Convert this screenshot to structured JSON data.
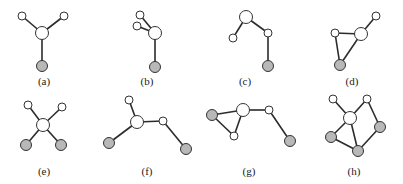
{
  "figure": {
    "colors": {
      "node_white": "#ffffff",
      "node_gray": "#b8b8b8",
      "edge": "#2b2b2b",
      "outline": "#333333"
    },
    "graphs": [
      {
        "label": "(a)",
        "nodes": [
          {
            "id": "hub",
            "type": "hub",
            "color": "white"
          },
          {
            "id": "n1",
            "type": "small",
            "color": "white"
          },
          {
            "id": "n2",
            "type": "small",
            "color": "white"
          },
          {
            "id": "n3",
            "type": "medium",
            "color": "gray"
          }
        ],
        "edges": [
          [
            "hub",
            "n1"
          ],
          [
            "hub",
            "n2"
          ],
          [
            "hub",
            "n3"
          ]
        ]
      },
      {
        "label": "(b)",
        "nodes": [
          {
            "id": "hub",
            "type": "hub",
            "color": "white"
          },
          {
            "id": "n1",
            "type": "small",
            "color": "white"
          },
          {
            "id": "n2",
            "type": "small",
            "color": "white"
          },
          {
            "id": "n3",
            "type": "medium",
            "color": "gray"
          }
        ],
        "edges": [
          [
            "hub",
            "n1"
          ],
          [
            "hub",
            "n2"
          ],
          [
            "hub",
            "n3"
          ]
        ]
      },
      {
        "label": "(c)",
        "nodes": [
          {
            "id": "hub",
            "type": "hub",
            "color": "white"
          },
          {
            "id": "n1",
            "type": "small",
            "color": "white"
          },
          {
            "id": "n2",
            "type": "small",
            "color": "white"
          },
          {
            "id": "n3",
            "type": "medium",
            "color": "gray"
          }
        ],
        "edges": [
          [
            "hub",
            "n1"
          ],
          [
            "hub",
            "n2"
          ],
          [
            "n2",
            "n3"
          ]
        ]
      },
      {
        "label": "(d)",
        "nodes": [
          {
            "id": "hub",
            "type": "hub",
            "color": "white"
          },
          {
            "id": "n1",
            "type": "small",
            "color": "white"
          },
          {
            "id": "n2",
            "type": "small",
            "color": "white"
          },
          {
            "id": "n3",
            "type": "medium",
            "color": "gray"
          }
        ],
        "edges": [
          [
            "hub",
            "n1"
          ],
          [
            "hub",
            "n2"
          ],
          [
            "hub",
            "n3"
          ],
          [
            "n1",
            "n3"
          ]
        ]
      },
      {
        "label": "(e)",
        "nodes": [
          {
            "id": "hub",
            "type": "hub",
            "color": "white"
          },
          {
            "id": "n1",
            "type": "small",
            "color": "white"
          },
          {
            "id": "n2",
            "type": "small",
            "color": "white"
          },
          {
            "id": "n3",
            "type": "medium",
            "color": "gray"
          },
          {
            "id": "n4",
            "type": "medium",
            "color": "gray"
          }
        ],
        "edges": [
          [
            "hub",
            "n1"
          ],
          [
            "hub",
            "n2"
          ],
          [
            "hub",
            "n3"
          ],
          [
            "hub",
            "n4"
          ]
        ]
      },
      {
        "label": "(f)",
        "nodes": [
          {
            "id": "hub",
            "type": "hub",
            "color": "white"
          },
          {
            "id": "n1",
            "type": "small",
            "color": "white"
          },
          {
            "id": "n2",
            "type": "small",
            "color": "white"
          },
          {
            "id": "n3",
            "type": "medium",
            "color": "gray"
          },
          {
            "id": "n4",
            "type": "medium",
            "color": "gray"
          }
        ],
        "edges": [
          [
            "hub",
            "n1"
          ],
          [
            "hub",
            "n2"
          ],
          [
            "hub",
            "n3"
          ],
          [
            "n2",
            "n4"
          ]
        ]
      },
      {
        "label": "(g)",
        "nodes": [
          {
            "id": "hub",
            "type": "hub",
            "color": "white"
          },
          {
            "id": "n1",
            "type": "medium",
            "color": "gray"
          },
          {
            "id": "n2",
            "type": "small",
            "color": "white"
          },
          {
            "id": "n3",
            "type": "small",
            "color": "white"
          },
          {
            "id": "n4",
            "type": "medium",
            "color": "gray"
          }
        ],
        "edges": [
          [
            "hub",
            "n1"
          ],
          [
            "hub",
            "n2"
          ],
          [
            "n1",
            "n2"
          ],
          [
            "hub",
            "n3"
          ],
          [
            "n3",
            "n4"
          ]
        ]
      },
      {
        "label": "(h)",
        "nodes": [
          {
            "id": "hub",
            "type": "hub",
            "color": "white"
          },
          {
            "id": "n1",
            "type": "small",
            "color": "white"
          },
          {
            "id": "n2",
            "type": "small",
            "color": "white"
          },
          {
            "id": "n3",
            "type": "medium",
            "color": "gray"
          },
          {
            "id": "n4",
            "type": "medium",
            "color": "gray"
          },
          {
            "id": "n5",
            "type": "medium",
            "color": "gray"
          }
        ],
        "edges": [
          [
            "hub",
            "n1"
          ],
          [
            "hub",
            "n2"
          ],
          [
            "hub",
            "n4"
          ],
          [
            "hub",
            "n5"
          ],
          [
            "n2",
            "n3"
          ],
          [
            "n3",
            "n5"
          ],
          [
            "n4",
            "n5"
          ]
        ]
      }
    ]
  }
}
